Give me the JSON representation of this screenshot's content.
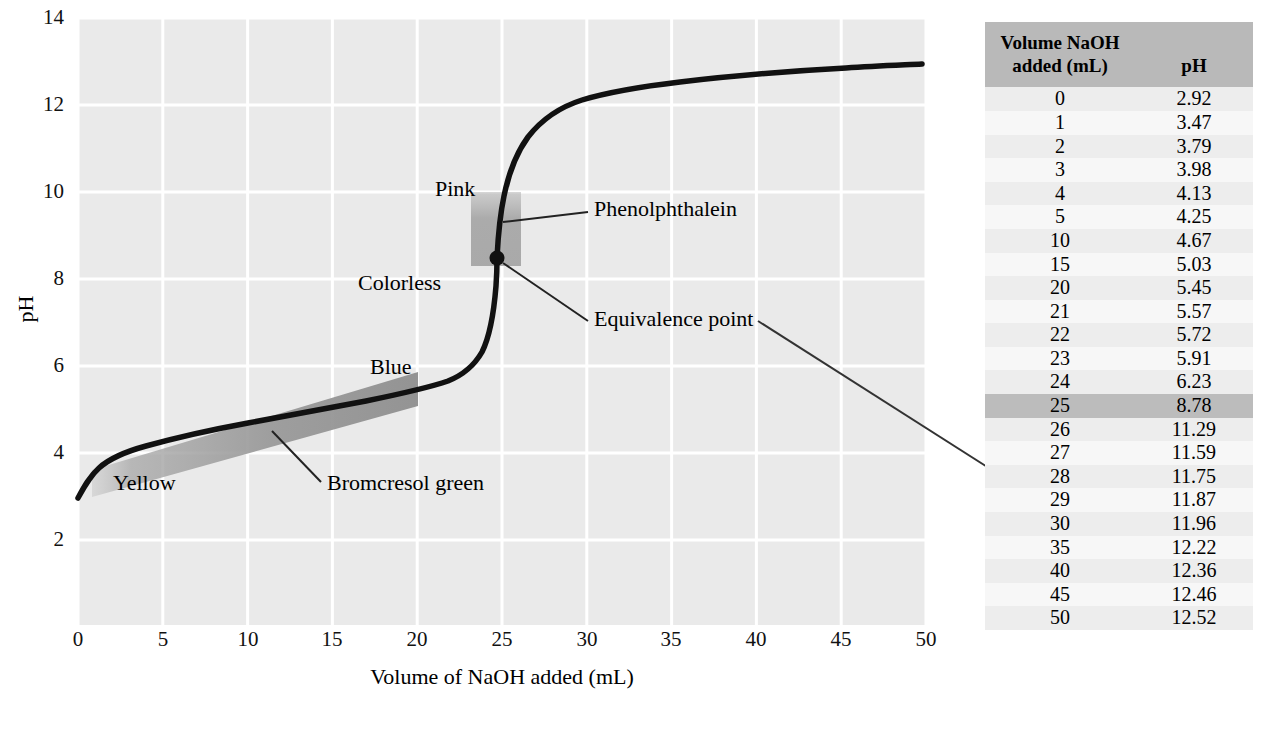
{
  "chart_data": {
    "type": "line",
    "title": "",
    "xlabel": "Volume of NaOH added (mL)",
    "ylabel": "pH",
    "xlim": [
      0,
      50
    ],
    "ylim": [
      0,
      14
    ],
    "xticks": [
      "0",
      "5",
      "10",
      "15",
      "20",
      "25",
      "30",
      "35",
      "40",
      "45",
      "50"
    ],
    "yticks": [
      "14",
      "12",
      "10",
      "8",
      "6",
      "4",
      "2"
    ],
    "grid": true,
    "legend": "none",
    "x": [
      0,
      1,
      2,
      3,
      4,
      5,
      10,
      15,
      20,
      21,
      22,
      23,
      24,
      25,
      26,
      27,
      28,
      29,
      30,
      35,
      40,
      45,
      50
    ],
    "y": [
      2.92,
      3.47,
      3.79,
      3.98,
      4.13,
      4.25,
      4.67,
      5.03,
      5.45,
      5.57,
      5.72,
      5.91,
      6.23,
      8.78,
      11.29,
      11.59,
      11.75,
      11.87,
      11.96,
      12.22,
      12.36,
      12.46,
      12.52
    ],
    "annotations": [
      {
        "name": "pink",
        "text": "Pink"
      },
      {
        "name": "colorless",
        "text": "Colorless"
      },
      {
        "name": "blue",
        "text": "Blue"
      },
      {
        "name": "yellow",
        "text": "Yellow"
      },
      {
        "name": "phenolphthalein",
        "text": "Phenolphthalein"
      },
      {
        "name": "bromcresol-green",
        "text": "Bromcresol green"
      },
      {
        "name": "equivalence-point",
        "text": "Equivalence point"
      }
    ],
    "equivalence_point": {
      "volume": 25,
      "ph": 8.78
    },
    "indicator_bands": [
      {
        "name": "phenolphthalein",
        "ph_range": [
          8.3,
          10.0
        ],
        "below_color_label": "Colorless",
        "above_color_label": "Pink"
      },
      {
        "name": "bromcresol green",
        "ph_range": [
          3.8,
          5.4
        ],
        "below_color_label": "Yellow",
        "above_color_label": "Blue"
      }
    ]
  },
  "table": {
    "headers": {
      "volume": "Volume NaOH added (mL)",
      "volume_line1": "Volume NaOH",
      "volume_line2": "added (mL)",
      "ph": "pH"
    },
    "rows": [
      {
        "volume": "0",
        "ph": "2.92",
        "highlight": false
      },
      {
        "volume": "1",
        "ph": "3.47",
        "highlight": false
      },
      {
        "volume": "2",
        "ph": "3.79",
        "highlight": false
      },
      {
        "volume": "3",
        "ph": "3.98",
        "highlight": false
      },
      {
        "volume": "4",
        "ph": "4.13",
        "highlight": false
      },
      {
        "volume": "5",
        "ph": "4.25",
        "highlight": false
      },
      {
        "volume": "10",
        "ph": "4.67",
        "highlight": false
      },
      {
        "volume": "15",
        "ph": "5.03",
        "highlight": false
      },
      {
        "volume": "20",
        "ph": "5.45",
        "highlight": false
      },
      {
        "volume": "21",
        "ph": "5.57",
        "highlight": false
      },
      {
        "volume": "22",
        "ph": "5.72",
        "highlight": false
      },
      {
        "volume": "23",
        "ph": "5.91",
        "highlight": false
      },
      {
        "volume": "24",
        "ph": "6.23",
        "highlight": false
      },
      {
        "volume": "25",
        "ph": "8.78",
        "highlight": true
      },
      {
        "volume": "26",
        "ph": "11.29",
        "highlight": false
      },
      {
        "volume": "27",
        "ph": "11.59",
        "highlight": false
      },
      {
        "volume": "28",
        "ph": "11.75",
        "highlight": false
      },
      {
        "volume": "29",
        "ph": "11.87",
        "highlight": false
      },
      {
        "volume": "30",
        "ph": "11.96",
        "highlight": false
      },
      {
        "volume": "35",
        "ph": "12.22",
        "highlight": false
      },
      {
        "volume": "40",
        "ph": "12.36",
        "highlight": false
      },
      {
        "volume": "45",
        "ph": "12.46",
        "highlight": false
      },
      {
        "volume": "50",
        "ph": "12.52",
        "highlight": false
      }
    ]
  },
  "colors": {
    "plot_background": "#eaeaea",
    "gridline": "#ffffff",
    "curve": "#111111",
    "band_phenolphthalein": "#b0b0b0",
    "band_bromcresol": "#9a9a9a",
    "table_header_bg": "#b9b9b9",
    "table_highlight_bg": "#bcbcbc",
    "table_row_odd": "#ededed",
    "table_row_even": "#f7f7f7"
  }
}
